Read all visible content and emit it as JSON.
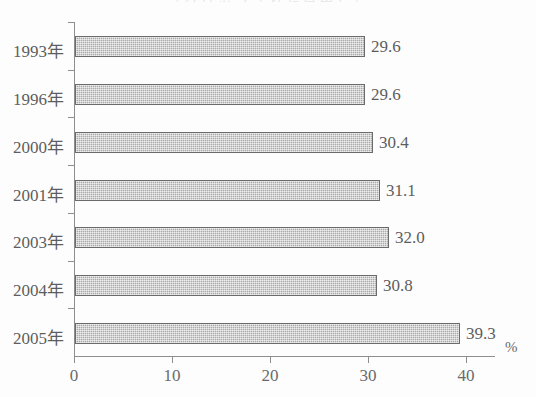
{
  "chart_data": {
    "type": "bar",
    "orientation": "horizontal",
    "title": "",
    "xlabel": "",
    "ylabel": "",
    "unit": "%",
    "categories": [
      "1993年",
      "1996年",
      "2000年",
      "2001年",
      "2003年",
      "2004年",
      "2005年"
    ],
    "values": [
      29.6,
      29.6,
      30.4,
      31.1,
      32.0,
      30.8,
      39.3
    ],
    "value_labels": [
      "29.6",
      "29.6",
      "30.4",
      "31.1",
      "32.0",
      "30.8",
      "39.3"
    ],
    "xlim": [
      0,
      43
    ],
    "xticks": [
      0,
      10,
      20,
      30,
      40
    ],
    "xtick_labels": [
      "0",
      "10",
      "20",
      "30",
      "40"
    ],
    "grid": false,
    "legend": null,
    "bar_color": "#a9a9a9",
    "bar_border_color": "#6b6b6b",
    "axis_color": "#8e8e8e",
    "text_color": "#5d5d5d"
  },
  "title_sliver": "［クリップされた見出し］"
}
